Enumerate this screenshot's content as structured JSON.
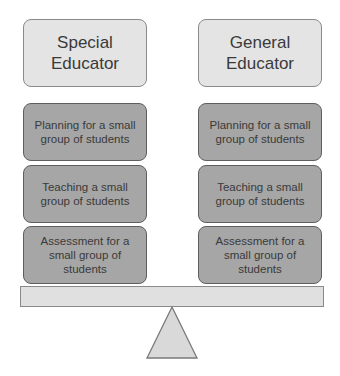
{
  "diagram": {
    "type": "seesaw-balance",
    "left": {
      "header": "Special\nEducator",
      "tasks": [
        "Planning for a small\ngroup of students",
        "Teaching a small\ngroup of students",
        "Assessment for a\nsmall group of\nstudents"
      ]
    },
    "right": {
      "header": "General\nEducator",
      "tasks": [
        "Planning for a small\ngroup of students",
        "Teaching a small\ngroup of students",
        "Assessment for a\nsmall group of\nstudents"
      ]
    },
    "colors": {
      "header_fill": "#e4e4e4",
      "task_fill": "#a6a6a6",
      "plank_fill": "#e0e0e0",
      "fulcrum_fill": "#d9d9d9",
      "text": "#3a3a3a"
    }
  }
}
